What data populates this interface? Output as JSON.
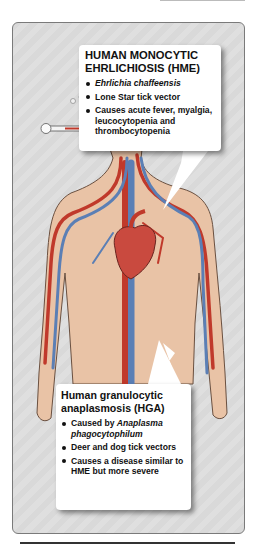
{
  "colors": {
    "panel_bg": "#dcdcdc",
    "skin": "#e9c3a6",
    "artery": "#c0392b",
    "vein": "#5b7fb5",
    "heart": "#c94a3f"
  },
  "hme_callout": {
    "title_line1": "HUMAN MONOCYTIC",
    "title_line2": "EHRLICHIOSIS (HME)",
    "items": [
      {
        "text": "Ehrlichia chaffeensis",
        "italic": true
      },
      {
        "text": "Lone Star tick vector"
      },
      {
        "text": "Causes acute fever, myalgia, leucocytopenia and  thrombocytopenia"
      }
    ]
  },
  "hga_callout": {
    "title_line1": "Human granulocytic",
    "title_line2": "anaplasmosis (HGA)",
    "items": [
      {
        "prefix": "Caused by ",
        "italic_text": "Anaplasma phagocytophilum"
      },
      {
        "text": "Deer and dog tick vectors"
      },
      {
        "text": "Causes a disease similar to HME but more severe"
      }
    ]
  },
  "figure": {
    "icons": [
      "thermometer-icon",
      "heart-icon",
      "blood-vessels-icon",
      "sweat-drops-icon"
    ]
  }
}
